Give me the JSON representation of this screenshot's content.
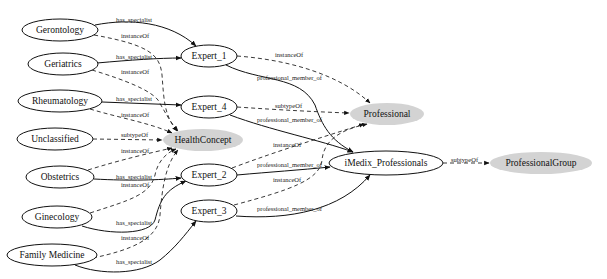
{
  "nodes": {
    "gerontology": {
      "label": "Gerontology",
      "cx": 60,
      "cy": 30,
      "rx": 38,
      "ry": 11,
      "fill": "#ffffff"
    },
    "geriatrics": {
      "label": "Geriatrics",
      "cx": 63,
      "cy": 64,
      "rx": 35,
      "ry": 11,
      "fill": "#ffffff"
    },
    "rheumatology": {
      "label": "Rheumatology",
      "cx": 60,
      "cy": 101,
      "rx": 42,
      "ry": 11,
      "fill": "#ffffff"
    },
    "unclassified": {
      "label": "Unclassified",
      "cx": 55,
      "cy": 139,
      "rx": 38,
      "ry": 11,
      "fill": "#ffffff"
    },
    "obstetrics": {
      "label": "Obstetrics",
      "cx": 60,
      "cy": 177,
      "rx": 34,
      "ry": 11,
      "fill": "#ffffff"
    },
    "ginecology": {
      "label": "Ginecology",
      "cx": 57,
      "cy": 217,
      "rx": 35,
      "ry": 11,
      "fill": "#ffffff"
    },
    "family_medicine": {
      "label": "Family Medicine",
      "cx": 52,
      "cy": 255,
      "rx": 45,
      "ry": 11,
      "fill": "#ffffff"
    },
    "expert_1": {
      "label": "Expert_1",
      "cx": 209,
      "cy": 56,
      "rx": 28,
      "ry": 11,
      "fill": "#ffffff"
    },
    "expert_4": {
      "label": "Expert_4",
      "cx": 209,
      "cy": 107,
      "rx": 28,
      "ry": 11,
      "fill": "#ffffff"
    },
    "expert_2": {
      "label": "Expert_2",
      "cx": 209,
      "cy": 175,
      "rx": 28,
      "ry": 11,
      "fill": "#ffffff"
    },
    "expert_3": {
      "label": "Expert_3",
      "cx": 209,
      "cy": 211,
      "rx": 28,
      "ry": 11,
      "fill": "#ffffff"
    },
    "health_concept": {
      "label": "HealthConcept",
      "cx": 203,
      "cy": 140,
      "rx": 40,
      "ry": 11,
      "fill": "#d3d3d3"
    },
    "professional": {
      "label": "Professional",
      "cx": 387,
      "cy": 114,
      "rx": 37,
      "ry": 11,
      "fill": "#d3d3d3"
    },
    "imedix_professionals": {
      "label": "iMedix_Professionals",
      "cx": 386,
      "cy": 163,
      "rx": 57,
      "ry": 12,
      "fill": "#ffffff"
    },
    "professional_group": {
      "label": "ProfessionalGroup",
      "cx": 541,
      "cy": 163,
      "rx": 51,
      "ry": 11,
      "fill": "#d3d3d3"
    }
  },
  "edge_labels": {
    "has_specialist": "has_specialist",
    "instance_of": "instanceOf",
    "subtype_of": "subtypeOf",
    "professional_member_of": "professional_member_of"
  },
  "edges": [
    {
      "from": "Gerontology",
      "to": "Expert_1",
      "label": "has_specialist",
      "style": "solid"
    },
    {
      "from": "Gerontology",
      "to": "HealthConcept",
      "label": "instanceOf",
      "style": "dashed"
    },
    {
      "from": "Geriatrics",
      "to": "Expert_1",
      "label": "has_specialist",
      "style": "solid"
    },
    {
      "from": "Geriatrics",
      "to": "HealthConcept",
      "label": "instanceOf",
      "style": "dashed"
    },
    {
      "from": "Rheumatology",
      "to": "Expert_4",
      "label": "has_specialist",
      "style": "solid"
    },
    {
      "from": "Rheumatology",
      "to": "HealthConcept",
      "label": "instanceOf",
      "style": "dashed"
    },
    {
      "from": "Unclassified",
      "to": "HealthConcept",
      "label": "subtypeOf",
      "style": "dashed"
    },
    {
      "from": "Obstetrics",
      "to": "HealthConcept",
      "label": "instanceOf",
      "style": "dashed"
    },
    {
      "from": "Obstetrics",
      "to": "Expert_2",
      "label": "has_specialist",
      "style": "solid"
    },
    {
      "from": "Ginecology",
      "to": "HealthConcept",
      "label": "instanceOf",
      "style": "dashed"
    },
    {
      "from": "Ginecology",
      "to": "Expert_2",
      "label": "has_specialist",
      "style": "solid"
    },
    {
      "from": "Family Medicine",
      "to": "HealthConcept",
      "label": "instanceOf",
      "style": "dashed"
    },
    {
      "from": "Family Medicine",
      "to": "Expert_3",
      "label": "has_specialist",
      "style": "solid"
    },
    {
      "from": "Expert_1",
      "to": "Professional",
      "label": "instanceOf",
      "style": "dashed"
    },
    {
      "from": "Expert_1",
      "to": "iMedix_Professionals",
      "label": "professional_member_of",
      "style": "solid"
    },
    {
      "from": "Expert_4",
      "to": "Professional",
      "label": "subtypeOf",
      "style": "dashed"
    },
    {
      "from": "Expert_4",
      "to": "iMedix_Professionals",
      "label": "professional_member_of",
      "style": "solid"
    },
    {
      "from": "Expert_2",
      "to": "Professional",
      "label": "instanceOf",
      "style": "dashed"
    },
    {
      "from": "Expert_2",
      "to": "iMedix_Professionals",
      "label": "professional_member_of",
      "style": "solid"
    },
    {
      "from": "Expert_3",
      "to": "Professional",
      "label": "instanceOf",
      "style": "dashed"
    },
    {
      "from": "Expert_3",
      "to": "iMedix_Professionals",
      "label": "professional_member_of",
      "style": "solid"
    },
    {
      "from": "iMedix_Professionals",
      "to": "ProfessionalGroup",
      "label": "subtypeOf",
      "style": "dashed"
    }
  ]
}
